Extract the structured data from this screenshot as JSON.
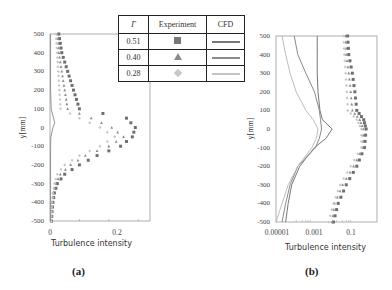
{
  "legend": {
    "headers": [
      "Γ",
      "Experiment",
      "CFD"
    ],
    "rows": [
      {
        "gamma": "0.51",
        "marker": "square",
        "color": "#777777",
        "cfd_color": "#777777"
      },
      {
        "gamma": "0.40",
        "marker": "triangle",
        "color": "#8a8a8a",
        "cfd_color": "#8a8a8a"
      },
      {
        "gamma": "0.28",
        "marker": "diamond",
        "color": "#c4c4c4",
        "cfd_color": "#bdbdbd"
      }
    ]
  },
  "panels": {
    "a": {
      "label": "(a)",
      "xlabel": "Turbulence intensity",
      "ylabel": "y[mm]",
      "yticks": [
        "500",
        "400",
        "300",
        "200",
        "100",
        "0",
        "-100",
        "-200",
        "-300",
        "-400",
        "-500"
      ],
      "xticks": [
        "0",
        "0.2"
      ]
    },
    "b": {
      "label": "(b)",
      "xlabel": "Turbulence intensity",
      "ylabel": "y[mm]",
      "yticks": [
        "500",
        "400",
        "300",
        "200",
        "100",
        "0",
        "-100",
        "-200",
        "-300",
        "-400",
        "-500"
      ],
      "xticks": [
        "0.00001",
        "0.001",
        "0.1"
      ]
    }
  },
  "chart_data": [
    {
      "type": "scatter",
      "title": "(a)",
      "xlabel": "Turbulence intensity",
      "ylabel": "y[mm]",
      "xscale": "linear",
      "xlim": [
        0,
        0.34
      ],
      "ylim": [
        -500,
        500
      ],
      "xticks": [
        0,
        0.2
      ],
      "yticks": [
        500,
        400,
        300,
        200,
        100,
        0,
        -100,
        -200,
        -300,
        -400,
        -500
      ],
      "grid": false,
      "legend_position": "table, upper right",
      "series": [
        {
          "name": "Γ=0.51 Experiment",
          "marker": "square",
          "y": [
            500,
            450,
            400,
            350,
            300,
            250,
            200,
            150,
            100,
            50,
            0,
            -50,
            -100,
            -150,
            -200,
            -250,
            -300,
            -350,
            -400,
            -450,
            -500
          ],
          "x": [
            0.03,
            0.035,
            0.04,
            0.05,
            0.06,
            0.07,
            0.08,
            0.09,
            0.1,
            0.26,
            0.29,
            0.28,
            0.24,
            0.16,
            0.1,
            0.05,
            0.025,
            0.015,
            0.01,
            0.007,
            0.005
          ]
        },
        {
          "name": "Γ=0.40 Experiment",
          "marker": "triangle",
          "y": [
            500,
            450,
            400,
            350,
            300,
            250,
            200,
            150,
            100,
            50,
            0,
            -50,
            -100,
            -150,
            -200,
            -250,
            -300,
            -350,
            -400,
            -450,
            -500
          ],
          "x": [
            0.025,
            0.028,
            0.03,
            0.035,
            0.04,
            0.045,
            0.05,
            0.055,
            0.06,
            0.14,
            0.21,
            0.25,
            0.2,
            0.12,
            0.07,
            0.035,
            0.02,
            0.012,
            0.008,
            0.006,
            0.005
          ]
        },
        {
          "name": "Γ=0.28 Experiment",
          "marker": "diamond",
          "y": [
            500,
            450,
            400,
            350,
            300,
            250,
            200,
            150,
            100,
            50,
            0,
            -50,
            -100,
            -150,
            -200,
            -250,
            -300,
            -350,
            -400,
            -450,
            -500
          ],
          "x": [
            0.02,
            0.022,
            0.024,
            0.026,
            0.028,
            0.03,
            0.032,
            0.034,
            0.036,
            0.1,
            0.17,
            0.22,
            0.17,
            0.1,
            0.05,
            0.025,
            0.015,
            0.01,
            0.007,
            0.005,
            0.004
          ]
        },
        {
          "name": "CFD (all Γ)",
          "type": "line",
          "y": [
            500,
            200,
            100,
            50,
            25,
            0,
            -50,
            -100,
            -500
          ],
          "x": [
            0.002,
            0.002,
            0.004,
            0.012,
            0.016,
            0.01,
            0.003,
            0.002,
            0.002
          ]
        }
      ]
    },
    {
      "type": "line",
      "title": "(b)",
      "xlabel": "Turbulence intensity",
      "ylabel": "y[mm]",
      "xscale": "log",
      "xlim": [
        1e-05,
        1
      ],
      "ylim": [
        -500,
        500
      ],
      "xticks": [
        1e-05,
        0.001,
        0.1
      ],
      "yticks": [
        500,
        400,
        300,
        200,
        100,
        0,
        -100,
        -200,
        -300,
        -400,
        -500
      ],
      "grid": false,
      "series": [
        {
          "name": "Γ=0.51 CFD",
          "type": "line",
          "y": [
            500,
            400,
            300,
            200,
            100,
            50,
            0,
            -50,
            -100,
            -200,
            -300,
            -400,
            -500
          ],
          "x": [
            0.0011,
            0.0011,
            0.0011,
            0.0012,
            0.0015,
            0.002,
            0.006,
            0.003,
            0.0008,
            0.00015,
            6e-05,
            4e-05,
            3e-05
          ]
        },
        {
          "name": "Γ=0.40 CFD",
          "type": "line",
          "y": [
            500,
            400,
            300,
            200,
            100,
            50,
            0,
            -50,
            -100,
            -200,
            -300,
            -400,
            -500
          ],
          "x": [
            8e-05,
            0.00012,
            0.0003,
            0.0008,
            0.0014,
            0.0016,
            0.0018,
            0.0014,
            0.0009,
            0.00012,
            5e-05,
            3e-05,
            2e-05
          ]
        },
        {
          "name": "Γ=0.28 CFD",
          "type": "line",
          "y": [
            500,
            400,
            300,
            200,
            100,
            50,
            0,
            -50,
            -100,
            -200,
            -300,
            -400,
            -500
          ],
          "x": [
            2e-05,
            3e-05,
            5e-05,
            0.0001,
            0.0003,
            0.0007,
            0.0012,
            0.001,
            0.0006,
            0.00012,
            4e-05,
            2e-05,
            1e-05
          ]
        },
        {
          "name": "Γ=0.51 Experiment",
          "marker": "square",
          "y": [
            500,
            400,
            300,
            200,
            100,
            50,
            0,
            -100,
            -200,
            -300,
            -400,
            -500
          ],
          "x": [
            0.035,
            0.04,
            0.06,
            0.08,
            0.1,
            0.22,
            0.29,
            0.24,
            0.1,
            0.03,
            0.012,
            0.007
          ]
        },
        {
          "name": "Γ=0.40 Experiment",
          "marker": "triangle",
          "y": [
            500,
            400,
            300,
            200,
            100,
            50,
            0,
            -100,
            -200,
            -300,
            -400,
            -500
          ],
          "x": [
            0.028,
            0.03,
            0.04,
            0.05,
            0.06,
            0.14,
            0.21,
            0.2,
            0.07,
            0.02,
            0.008,
            0.006
          ]
        },
        {
          "name": "Γ=0.28 Experiment",
          "marker": "diamond",
          "y": [
            500,
            400,
            300,
            200,
            100,
            50,
            0,
            -100,
            -200,
            -300,
            -400,
            -500
          ],
          "x": [
            0.022,
            0.024,
            0.028,
            0.032,
            0.036,
            0.1,
            0.17,
            0.17,
            0.05,
            0.015,
            0.007,
            0.004
          ]
        }
      ]
    }
  ]
}
